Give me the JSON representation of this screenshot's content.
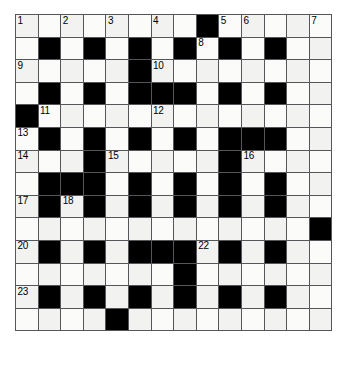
{
  "puzzle": {
    "name": "crossword-grid",
    "type": "crossword",
    "columns": 14,
    "rows": 14,
    "cell_size_px": 22.6,
    "colors": {
      "block": "#000000",
      "cell": "#f2f2f0",
      "cell_alt": "#fbfbfa",
      "grid_line": "#55555a",
      "border": "#1a1a1a",
      "number_text": "#000000",
      "page_background": "#ffffff"
    },
    "legend": {
      "0": "white-cell",
      "1": "black-cell"
    },
    "grid": [
      [
        0,
        0,
        0,
        0,
        0,
        0,
        0,
        0,
        1,
        0,
        0,
        0,
        0,
        0
      ],
      [
        0,
        1,
        0,
        1,
        0,
        1,
        0,
        1,
        0,
        1,
        0,
        1,
        0,
        0
      ],
      [
        0,
        0,
        0,
        0,
        0,
        1,
        0,
        0,
        0,
        0,
        0,
        0,
        0,
        0
      ],
      [
        0,
        1,
        0,
        1,
        0,
        1,
        1,
        1,
        0,
        1,
        0,
        1,
        0,
        0
      ],
      [
        1,
        0,
        0,
        0,
        0,
        0,
        0,
        0,
        0,
        0,
        0,
        0,
        0,
        0
      ],
      [
        0,
        1,
        0,
        1,
        0,
        1,
        0,
        1,
        0,
        1,
        1,
        1,
        0,
        0
      ],
      [
        0,
        0,
        0,
        1,
        0,
        0,
        0,
        0,
        0,
        1,
        0,
        0,
        0,
        0
      ],
      [
        0,
        1,
        1,
        1,
        0,
        1,
        0,
        1,
        0,
        1,
        0,
        1,
        0,
        0
      ],
      [
        0,
        1,
        0,
        1,
        0,
        1,
        0,
        1,
        0,
        1,
        0,
        1,
        0,
        0
      ],
      [
        0,
        0,
        0,
        0,
        0,
        0,
        0,
        0,
        0,
        0,
        0,
        0,
        0,
        1
      ],
      [
        0,
        1,
        0,
        1,
        0,
        1,
        1,
        1,
        0,
        1,
        0,
        1,
        0,
        0
      ],
      [
        0,
        0,
        0,
        0,
        0,
        0,
        0,
        1,
        0,
        0,
        0,
        0,
        0,
        0
      ],
      [
        0,
        1,
        0,
        1,
        0,
        1,
        0,
        1,
        0,
        1,
        0,
        1,
        0,
        0
      ],
      [
        0,
        0,
        0,
        0,
        1,
        0,
        0,
        0,
        0,
        0,
        0,
        0,
        0,
        0
      ]
    ],
    "numbers": [
      {
        "n": "1",
        "row": 0,
        "col": 0
      },
      {
        "n": "2",
        "row": 0,
        "col": 2
      },
      {
        "n": "3",
        "row": 0,
        "col": 4
      },
      {
        "n": "4",
        "row": 0,
        "col": 6
      },
      {
        "n": "5",
        "row": 0,
        "col": 9
      },
      {
        "n": "6",
        "row": 0,
        "col": 10
      },
      {
        "n": "7",
        "row": 0,
        "col": 13
      },
      {
        "n": "8",
        "row": 1,
        "col": 8
      },
      {
        "n": "9",
        "row": 2,
        "col": 0
      },
      {
        "n": "10",
        "row": 2,
        "col": 6
      },
      {
        "n": "11",
        "row": 4,
        "col": 1
      },
      {
        "n": "12",
        "row": 4,
        "col": 6
      },
      {
        "n": "13",
        "row": 5,
        "col": 0
      },
      {
        "n": "14",
        "row": 6,
        "col": 0
      },
      {
        "n": "15",
        "row": 6,
        "col": 4
      },
      {
        "n": "16",
        "row": 6,
        "col": 10
      },
      {
        "n": "17",
        "row": 8,
        "col": 0
      },
      {
        "n": "18",
        "row": 8,
        "col": 2
      },
      {
        "n": "19",
        "row": 9,
        "col": 13
      },
      {
        "n": "20",
        "row": 10,
        "col": 0
      },
      {
        "n": "21",
        "row": 10,
        "col": 6
      },
      {
        "n": "22",
        "row": 10,
        "col": 8
      },
      {
        "n": "23",
        "row": 12,
        "col": 0
      },
      {
        "n": "24",
        "row": 12,
        "col": 5
      }
    ]
  }
}
